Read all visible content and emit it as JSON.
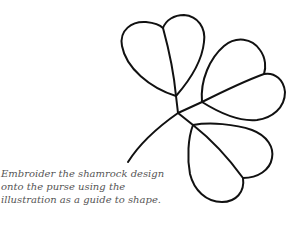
{
  "figure": {
    "stroke_color": "#111111"
  },
  "caption": {
    "lines": [
      "Embroider the shamrock design",
      "onto the purse using the",
      "illustration as a guide to shape."
    ]
  }
}
